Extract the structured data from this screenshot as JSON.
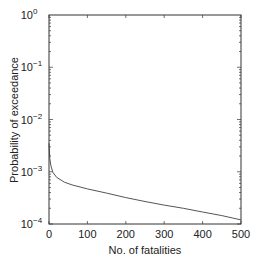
{
  "chart_data": {
    "type": "line",
    "title": "",
    "xlabel": "No. of fatalities",
    "ylabel": "Probability of exceedance",
    "xlim": [
      0,
      500
    ],
    "ylim": [
      0.0001,
      1
    ],
    "yscale": "log",
    "grid": false,
    "x_ticks": [
      0,
      100,
      200,
      300,
      400,
      500
    ],
    "x_tick_labels": [
      "0",
      "100",
      "200",
      "300",
      "400",
      "500"
    ],
    "y_ticks": [
      1,
      0.1,
      0.01,
      0.001,
      0.0001
    ],
    "y_tick_labels": [
      {
        "base": "10",
        "exp": "0"
      },
      {
        "base": "10",
        "exp": "−1"
      },
      {
        "base": "10",
        "exp": "−2"
      },
      {
        "base": "10",
        "exp": "−3"
      },
      {
        "base": "10",
        "exp": "−4"
      }
    ],
    "series": [
      {
        "name": "exceedance curve",
        "color": "#555555",
        "x": [
          0,
          2,
          5,
          10,
          20,
          40,
          60,
          100,
          150,
          200,
          250,
          300,
          350,
          400,
          450,
          500
        ],
        "y": [
          0.0035,
          0.0018,
          0.0013,
          0.00098,
          0.00078,
          0.00063,
          0.00056,
          0.00047,
          0.00039,
          0.00032,
          0.00027,
          0.00023,
          0.0002,
          0.00017,
          0.000145,
          0.00012
        ]
      }
    ]
  }
}
